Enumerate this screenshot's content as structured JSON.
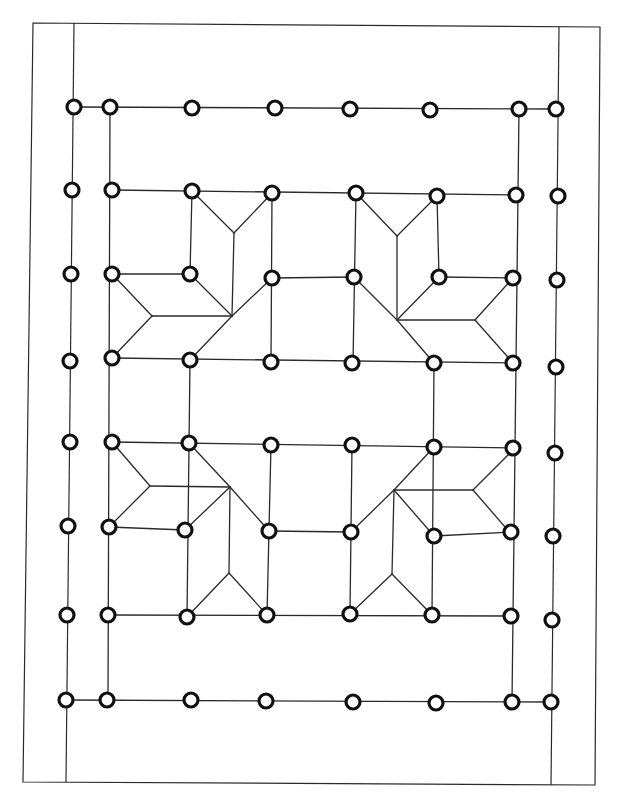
{
  "diagram": {
    "type": "geometric line-pattern (quilt block layout)",
    "colors": {
      "stroke": "#2a2a2a",
      "node_stroke": "#111111",
      "background": "#ffffff"
    },
    "node_radius": 7,
    "frame": [
      [
        33,
        23
      ],
      [
        600,
        27
      ],
      [
        595,
        785
      ],
      [
        23,
        782
      ]
    ],
    "border_lines": [
      [
        [
          74,
          23
        ],
        [
          66,
          782
        ]
      ],
      [
        [
          559,
          27
        ],
        [
          551,
          785
        ]
      ]
    ],
    "nodes": [
      [
        74,
        107
      ],
      [
        110,
        107
      ],
      [
        192,
        108
      ],
      [
        275,
        108
      ],
      [
        350,
        109
      ],
      [
        430,
        110
      ],
      [
        519,
        109
      ],
      [
        556,
        109
      ],
      [
        72,
        190
      ],
      [
        112,
        190
      ],
      [
        192,
        191
      ],
      [
        272,
        193
      ],
      [
        356,
        193
      ],
      [
        437,
        196
      ],
      [
        516,
        195
      ],
      [
        558,
        196
      ],
      [
        71,
        274
      ],
      [
        112,
        274
      ],
      [
        190,
        274
      ],
      [
        272,
        278
      ],
      [
        354,
        277
      ],
      [
        439,
        277
      ],
      [
        513,
        278
      ],
      [
        557,
        280
      ],
      [
        70,
        361
      ],
      [
        112,
        358
      ],
      [
        190,
        360
      ],
      [
        271,
        362
      ],
      [
        352,
        363
      ],
      [
        434,
        363
      ],
      [
        513,
        363
      ],
      [
        556,
        367
      ],
      [
        70,
        442
      ],
      [
        112,
        442
      ],
      [
        189,
        443
      ],
      [
        271,
        445
      ],
      [
        352,
        445
      ],
      [
        434,
        447
      ],
      [
        513,
        448
      ],
      [
        555,
        453
      ],
      [
        68,
        526
      ],
      [
        109,
        527
      ],
      [
        185,
        530
      ],
      [
        269,
        531
      ],
      [
        351,
        532
      ],
      [
        434,
        536
      ],
      [
        511,
        532
      ],
      [
        553,
        536
      ],
      [
        67,
        615
      ],
      [
        108,
        615
      ],
      [
        187,
        617
      ],
      [
        267,
        615
      ],
      [
        350,
        614
      ],
      [
        432,
        615
      ],
      [
        511,
        616
      ],
      [
        552,
        620
      ],
      [
        66,
        700
      ],
      [
        107,
        700
      ],
      [
        191,
        700
      ],
      [
        266,
        701
      ],
      [
        353,
        702
      ],
      [
        436,
        703
      ],
      [
        512,
        702
      ],
      [
        551,
        702
      ]
    ],
    "edges": [
      [
        [
          74,
          107
        ],
        [
          556,
          109
        ]
      ],
      [
        [
          110,
          107
        ],
        [
          108,
          700
        ]
      ],
      [
        [
          519,
          109
        ],
        [
          512,
          702
        ]
      ],
      [
        [
          66,
          700
        ],
        [
          551,
          702
        ]
      ],
      [
        [
          112,
          190
        ],
        [
          516,
          195
        ]
      ],
      [
        [
          112,
          274
        ],
        [
          190,
          274
        ]
      ],
      [
        [
          272,
          278
        ],
        [
          354,
          277
        ]
      ],
      [
        [
          439,
          277
        ],
        [
          513,
          278
        ]
      ],
      [
        [
          112,
          358
        ],
        [
          513,
          363
        ]
      ],
      [
        [
          112,
          442
        ],
        [
          513,
          448
        ]
      ],
      [
        [
          109,
          527
        ],
        [
          185,
          530
        ]
      ],
      [
        [
          269,
          531
        ],
        [
          351,
          532
        ]
      ],
      [
        [
          434,
          536
        ],
        [
          511,
          532
        ]
      ],
      [
        [
          108,
          615
        ],
        [
          511,
          616
        ]
      ],
      [
        [
          192,
          191
        ],
        [
          190,
          274
        ]
      ],
      [
        [
          272,
          193
        ],
        [
          271,
          362
        ]
      ],
      [
        [
          356,
          193
        ],
        [
          353,
          363
        ]
      ],
      [
        [
          437,
          196
        ],
        [
          439,
          277
        ]
      ],
      [
        [
          190,
          360
        ],
        [
          187,
          617
        ]
      ],
      [
        [
          271,
          445
        ],
        [
          267,
          615
        ]
      ],
      [
        [
          352,
          445
        ],
        [
          350,
          614
        ]
      ],
      [
        [
          434,
          363
        ],
        [
          432,
          615
        ]
      ],
      [
        [
          192,
          191
        ],
        [
          234,
          233
        ]
      ],
      [
        [
          272,
          193
        ],
        [
          234,
          233
        ]
      ],
      [
        [
          234,
          233
        ],
        [
          232,
          316
        ]
      ],
      [
        [
          112,
          274
        ],
        [
          152,
          316
        ]
      ],
      [
        [
          112,
          358
        ],
        [
          152,
          316
        ]
      ],
      [
        [
          152,
          316
        ],
        [
          232,
          316
        ]
      ],
      [
        [
          190,
          274
        ],
        [
          232,
          316
        ]
      ],
      [
        [
          272,
          278
        ],
        [
          232,
          316
        ]
      ],
      [
        [
          232,
          316
        ],
        [
          190,
          360
        ]
      ],
      [
        [
          356,
          193
        ],
        [
          397,
          236
        ]
      ],
      [
        [
          437,
          196
        ],
        [
          397,
          236
        ]
      ],
      [
        [
          397,
          236
        ],
        [
          397,
          320
        ]
      ],
      [
        [
          513,
          278
        ],
        [
          475,
          320
        ]
      ],
      [
        [
          513,
          363
        ],
        [
          475,
          320
        ]
      ],
      [
        [
          475,
          320
        ],
        [
          397,
          320
        ]
      ],
      [
        [
          354,
          277
        ],
        [
          397,
          320
        ]
      ],
      [
        [
          439,
          277
        ],
        [
          397,
          320
        ]
      ],
      [
        [
          397,
          320
        ],
        [
          434,
          363
        ]
      ],
      [
        [
          112,
          442
        ],
        [
          150,
          486
        ]
      ],
      [
        [
          109,
          527
        ],
        [
          150,
          486
        ]
      ],
      [
        [
          150,
          486
        ],
        [
          230,
          487
        ]
      ],
      [
        [
          189,
          443
        ],
        [
          230,
          487
        ]
      ],
      [
        [
          230,
          487
        ],
        [
          269,
          531
        ]
      ],
      [
        [
          230,
          487
        ],
        [
          185,
          530
        ]
      ],
      [
        [
          230,
          487
        ],
        [
          229,
          573
        ]
      ],
      [
        [
          229,
          573
        ],
        [
          187,
          617
        ]
      ],
      [
        [
          229,
          573
        ],
        [
          267,
          615
        ]
      ],
      [
        [
          434,
          447
        ],
        [
          394,
          490
        ]
      ],
      [
        [
          394,
          490
        ],
        [
          473,
          490
        ]
      ],
      [
        [
          514,
          449
        ],
        [
          473,
          490
        ]
      ],
      [
        [
          512,
          535
        ],
        [
          473,
          490
        ]
      ],
      [
        [
          394,
          490
        ],
        [
          351,
          532
        ]
      ],
      [
        [
          394,
          490
        ],
        [
          434,
          536
        ]
      ],
      [
        [
          394,
          490
        ],
        [
          392,
          574
        ]
      ],
      [
        [
          392,
          574
        ],
        [
          350,
          614
        ]
      ],
      [
        [
          392,
          574
        ],
        [
          432,
          615
        ]
      ]
    ]
  }
}
